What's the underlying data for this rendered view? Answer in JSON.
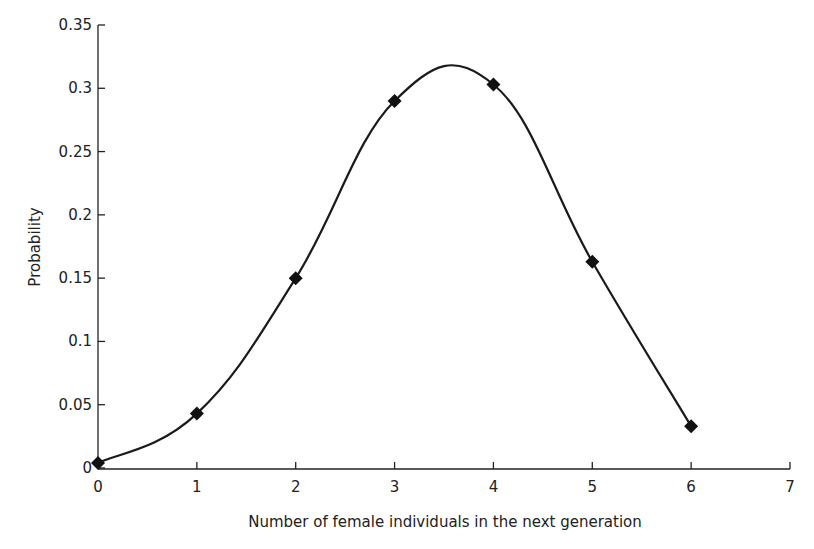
{
  "chart_data": {
    "type": "line",
    "title": "",
    "xlabel": "Number of female individuals in the next generation",
    "ylabel": "Probability",
    "x": [
      0,
      1,
      2,
      3,
      4,
      5,
      6
    ],
    "series": [
      {
        "name": "Probability",
        "values": [
          0.004,
          0.043,
          0.15,
          0.29,
          0.303,
          0.163,
          0.033
        ],
        "marker": "diamond",
        "smooth": true
      }
    ],
    "xlim": [
      0,
      7
    ],
    "ylim": [
      0,
      0.35
    ],
    "xticks": [
      "0",
      "1",
      "2",
      "3",
      "4",
      "5",
      "6",
      "7"
    ],
    "yticks": [
      "0",
      "0.05",
      "0.1",
      "0.15",
      "0.2",
      "0.25",
      "0.3",
      "0.35"
    ],
    "grid": false,
    "legend": "none"
  },
  "colors": {
    "line": "#1a1a1a",
    "marker": "#111111",
    "axis": "#222222",
    "background": "#ffffff"
  }
}
